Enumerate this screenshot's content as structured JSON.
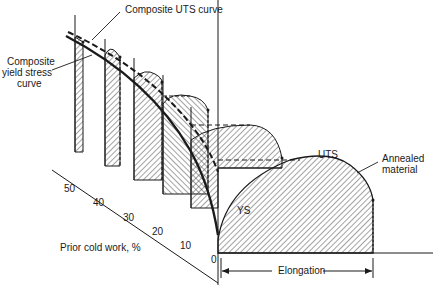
{
  "diagram": {
    "type": "3d-stress-strain-slabs",
    "labels": {
      "composite_uts": "Composite UTS curve",
      "composite_ys_line1": "Composite",
      "composite_ys_line2": "yield stress",
      "composite_ys_line3": "curve",
      "uts": "UTS",
      "ys": "YS",
      "annealed_line1": "Annealed",
      "annealed_line2": "material",
      "axis_cold_work": "Prior cold work, %",
      "axis_elongation": "Elongation"
    },
    "cold_work_ticks": [
      "50",
      "40",
      "30",
      "20",
      "10",
      "0"
    ],
    "colors": {
      "ink": "#1a1a1a",
      "background": "#ffffff"
    }
  }
}
